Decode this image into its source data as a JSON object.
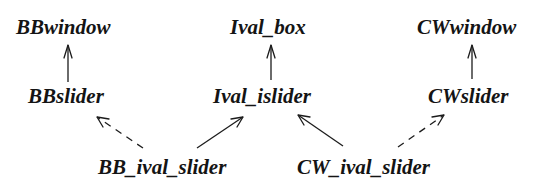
{
  "diagram": {
    "type": "class-inheritance-graph",
    "nodes": {
      "bbwindow": {
        "label": "BBwindow"
      },
      "ival_box": {
        "label": "Ival_box"
      },
      "cwwindow": {
        "label": "CWwindow"
      },
      "bbslider": {
        "label": "BBslider"
      },
      "ival_islider": {
        "label": "Ival_islider"
      },
      "cwslider": {
        "label": "CWslider"
      },
      "bb_ival_slider": {
        "label": "BB_ival_slider"
      },
      "cw_ival_slider": {
        "label": "CW_ival_slider"
      }
    },
    "edges": [
      {
        "from": "BBslider",
        "to": "BBwindow",
        "style": "solid"
      },
      {
        "from": "Ival_islider",
        "to": "Ival_box",
        "style": "solid"
      },
      {
        "from": "CWslider",
        "to": "CWwindow",
        "style": "solid"
      },
      {
        "from": "BB_ival_slider",
        "to": "BBslider",
        "style": "dashed"
      },
      {
        "from": "BB_ival_slider",
        "to": "Ival_islider",
        "style": "solid"
      },
      {
        "from": "CW_ival_slider",
        "to": "Ival_islider",
        "style": "solid"
      },
      {
        "from": "CW_ival_slider",
        "to": "CWslider",
        "style": "dashed"
      }
    ],
    "colors": {
      "text": "#141414",
      "line": "#1c1c1c",
      "background": "#ffffff"
    }
  }
}
